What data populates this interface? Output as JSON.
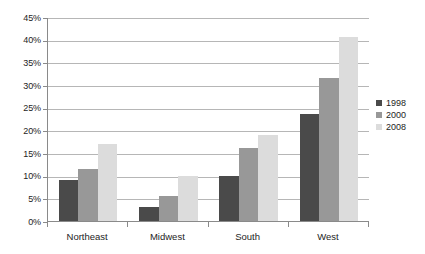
{
  "chart_data": {
    "type": "bar",
    "title": "",
    "subtitle": "",
    "xlabel": "",
    "ylabel": "",
    "categories": [
      "Northeast",
      "Midwest",
      "South",
      "West"
    ],
    "series": [
      {
        "name": "1998",
        "color": "#4a4a4a",
        "values": [
          9,
          3,
          10,
          23.5
        ]
      },
      {
        "name": "2000",
        "color": "#989898",
        "values": [
          11.5,
          5.5,
          16,
          31.5
        ]
      },
      {
        "name": "2008",
        "color": "#dcdcdc",
        "values": [
          17,
          10,
          19,
          40.5
        ]
      }
    ],
    "ylim": [
      0,
      45
    ],
    "ytick_values": [
      0,
      5,
      10,
      15,
      20,
      25,
      30,
      35,
      40,
      45
    ],
    "ytick_labels": [
      "0%",
      "5%",
      "10%",
      "15%",
      "20%",
      "25%",
      "30%",
      "35%",
      "40%",
      "45%"
    ],
    "grid": true,
    "grid_axis": "y",
    "legend_position": "right",
    "legend_entries": [
      "1998",
      "2000",
      "2008"
    ],
    "background_color": "#ffffff",
    "axis_color": "#8a8a8a",
    "gridline_color": "#b6b6b6"
  }
}
